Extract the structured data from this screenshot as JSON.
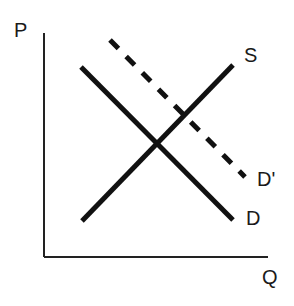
{
  "diagram": {
    "type": "supply-demand",
    "axes": {
      "y_label": "P",
      "x_label": "Q"
    },
    "curves": [
      {
        "id": "supply",
        "label": "S",
        "style": "solid",
        "direction": "upward-sloping"
      },
      {
        "id": "demand",
        "label": "D",
        "style": "solid",
        "direction": "downward-sloping"
      },
      {
        "id": "demand-shifted",
        "label": "D'",
        "style": "dashed",
        "direction": "downward-sloping"
      }
    ],
    "colors": {
      "line": "#111111",
      "axis": "#222222",
      "background": "#ffffff"
    }
  }
}
